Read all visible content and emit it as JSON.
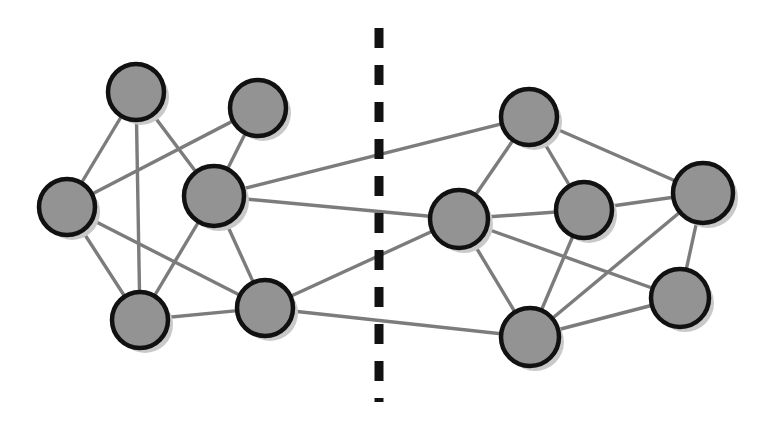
{
  "figure": {
    "width": 769,
    "height": 425,
    "background_color": "#ffffff"
  },
  "style": {
    "node_fill": "#939393",
    "node_stroke": "#111111",
    "node_stroke_width": 4.5,
    "node_shadow_color": "#c9c9c9",
    "node_shadow_offset_x": 5,
    "node_shadow_offset_y": 5,
    "edge_color": "#7c7c7c",
    "edge_width": 3.4,
    "cut_color": "#121212",
    "cut_width": 9,
    "cut_dash": "20 17"
  },
  "cut_line": {
    "label": "partition-cut",
    "x": 379,
    "y_start": 28,
    "y_end": 402
  },
  "clusters": [
    {
      "id": "left",
      "label": "Left partition",
      "node_count": 6
    },
    {
      "id": "right",
      "label": "Right partition",
      "node_count": 6
    }
  ],
  "nodes": [
    {
      "id": "L1",
      "label": "",
      "cluster": "left",
      "cx": 136,
      "cy": 92,
      "r": 28
    },
    {
      "id": "L2",
      "label": "",
      "cluster": "left",
      "cx": 258,
      "cy": 108,
      "r": 28
    },
    {
      "id": "L3",
      "label": "",
      "cluster": "left",
      "cx": 67,
      "cy": 207,
      "r": 28
    },
    {
      "id": "L4",
      "label": "",
      "cluster": "left",
      "cx": 214,
      "cy": 196,
      "r": 30
    },
    {
      "id": "L5",
      "label": "",
      "cluster": "left",
      "cx": 140,
      "cy": 320,
      "r": 28
    },
    {
      "id": "L6",
      "label": "",
      "cluster": "left",
      "cx": 265,
      "cy": 308,
      "r": 28
    },
    {
      "id": "R1",
      "label": "",
      "cluster": "right",
      "cx": 529,
      "cy": 117,
      "r": 28
    },
    {
      "id": "R2",
      "label": "",
      "cluster": "right",
      "cx": 459,
      "cy": 219,
      "r": 29
    },
    {
      "id": "R3",
      "label": "",
      "cluster": "right",
      "cx": 584,
      "cy": 210,
      "r": 28
    },
    {
      "id": "R4",
      "label": "",
      "cluster": "right",
      "cx": 703,
      "cy": 193,
      "r": 30
    },
    {
      "id": "R5",
      "label": "",
      "cluster": "right",
      "cx": 530,
      "cy": 337,
      "r": 29
    },
    {
      "id": "R6",
      "label": "",
      "cluster": "right",
      "cx": 680,
      "cy": 298,
      "r": 29
    }
  ],
  "edges": [
    {
      "source": "L1",
      "target": "L3",
      "kind": "intra"
    },
    {
      "source": "L1",
      "target": "L4",
      "kind": "intra"
    },
    {
      "source": "L1",
      "target": "L5",
      "kind": "intra"
    },
    {
      "source": "L2",
      "target": "L3",
      "kind": "intra"
    },
    {
      "source": "L2",
      "target": "L4",
      "kind": "intra"
    },
    {
      "source": "L3",
      "target": "L5",
      "kind": "intra"
    },
    {
      "source": "L3",
      "target": "L6",
      "kind": "intra"
    },
    {
      "source": "L4",
      "target": "L5",
      "kind": "intra"
    },
    {
      "source": "L4",
      "target": "L6",
      "kind": "intra"
    },
    {
      "source": "L5",
      "target": "L6",
      "kind": "intra"
    },
    {
      "source": "R1",
      "target": "R2",
      "kind": "intra"
    },
    {
      "source": "R1",
      "target": "R3",
      "kind": "intra"
    },
    {
      "source": "R1",
      "target": "R4",
      "kind": "intra"
    },
    {
      "source": "R2",
      "target": "R3",
      "kind": "intra"
    },
    {
      "source": "R2",
      "target": "R5",
      "kind": "intra"
    },
    {
      "source": "R2",
      "target": "R6",
      "kind": "intra"
    },
    {
      "source": "R3",
      "target": "R4",
      "kind": "intra"
    },
    {
      "source": "R3",
      "target": "R5",
      "kind": "intra"
    },
    {
      "source": "R4",
      "target": "R5",
      "kind": "intra"
    },
    {
      "source": "R4",
      "target": "R6",
      "kind": "intra"
    },
    {
      "source": "R5",
      "target": "R6",
      "kind": "intra"
    },
    {
      "source": "L4",
      "target": "R1",
      "kind": "cut"
    },
    {
      "source": "L4",
      "target": "R2",
      "kind": "cut"
    },
    {
      "source": "L6",
      "target": "R2",
      "kind": "cut"
    },
    {
      "source": "L6",
      "target": "R5",
      "kind": "cut"
    }
  ],
  "cut_edge_count": 4
}
